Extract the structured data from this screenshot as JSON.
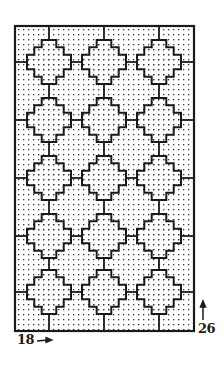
{
  "figure": {
    "colors": {
      "ink": "#1a1a1a",
      "background": "#ffffff",
      "dots": "#333333"
    },
    "frame": {
      "x": 15,
      "y": 26,
      "width": 179,
      "height": 305
    },
    "dot_pitch": 5,
    "motif_grid": {
      "columns": 3,
      "rows": 5,
      "column_centers_x": [
        49,
        104,
        159
      ],
      "row_centers_y": [
        62,
        120,
        178,
        236,
        292
      ],
      "half_size": 22
    },
    "annotations": {
      "width": {
        "text": "18",
        "arrow": "→"
      },
      "height": {
        "text": "26",
        "arrow": "↑"
      }
    }
  }
}
